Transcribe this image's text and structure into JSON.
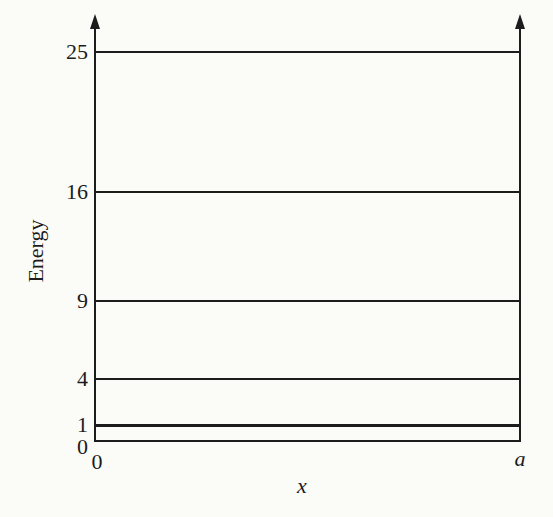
{
  "figure": {
    "background_color": "#fbfbf8",
    "ink_color": "#1c1c1c"
  },
  "chart_data": {
    "type": "line",
    "subtype": "energy-level-diagram",
    "title": "",
    "ylabel": "Energy",
    "xlabel": "x",
    "ylim": [
      0,
      25
    ],
    "grid": false,
    "legend_position": "none",
    "levels": [
      {
        "label": "1",
        "value": 1
      },
      {
        "label": "4",
        "value": 4
      },
      {
        "label": "9",
        "value": 9
      },
      {
        "label": "16",
        "value": 16
      },
      {
        "label": "25",
        "value": 25
      }
    ],
    "y_origin_label": "0",
    "x_ticks": [
      {
        "label": "0"
      },
      {
        "label": "a"
      }
    ]
  }
}
